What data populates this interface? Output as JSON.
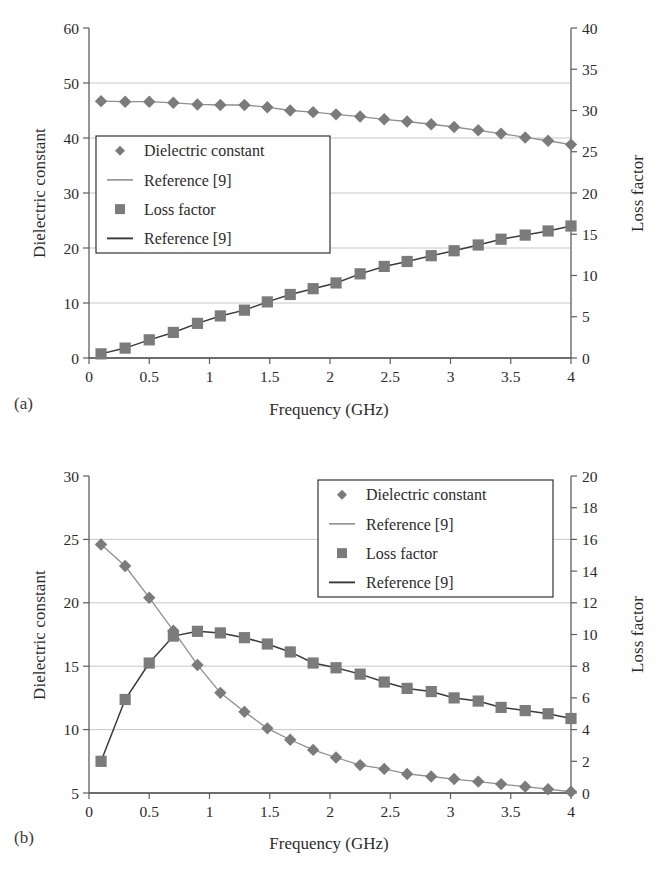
{
  "figure": {
    "panel_a_label": "(a)",
    "panel_b_label": "(b)"
  },
  "colors": {
    "marker_gray": "#7b7b7b",
    "line_light": "#8f8f8f",
    "line_dark": "#3a3a3a",
    "grid": "#b9b9b9",
    "axis": "#5e5e5e",
    "text": "#2b2b2b"
  },
  "legend": {
    "entries": [
      {
        "label": "Dielectric constant",
        "marker": "diamond-marker"
      },
      {
        "label": "Reference [9]",
        "marker": "light-line-marker"
      },
      {
        "label": "Loss factor",
        "marker": "square-marker"
      },
      {
        "label": "Reference [9]",
        "marker": "dark-line-marker"
      }
    ]
  },
  "chart_data": [
    {
      "id": "panel-a",
      "type": "scatter",
      "title": "",
      "panel": "(a)",
      "xlabel": "Frequency (GHz)",
      "ylabel": "Dielectric constant",
      "y2label": "Loss factor",
      "xlim": [
        0,
        4
      ],
      "ylim": [
        0,
        60
      ],
      "y2lim": [
        0,
        40
      ],
      "xticks": [
        0,
        0.5,
        1,
        1.5,
        2,
        2.5,
        3,
        3.5,
        4
      ],
      "xticklabels": [
        "0",
        "0.5",
        "1",
        "1.5",
        "2",
        "2.5",
        "3",
        "3.5",
        "4"
      ],
      "yticks": [
        0,
        10,
        20,
        30,
        40,
        50,
        60
      ],
      "yticklabels": [
        "0",
        "10",
        "20",
        "30",
        "40",
        "50",
        "60"
      ],
      "y2ticks": [
        0,
        5,
        10,
        15,
        20,
        25,
        30,
        35,
        40
      ],
      "y2ticklabels": [
        "0",
        "5",
        "10",
        "15",
        "20",
        "25",
        "30",
        "35",
        "40"
      ],
      "grid": true,
      "legend_position": "center-left",
      "series": [
        {
          "name": "Dielectric constant",
          "axis": "left",
          "marker": "diamond",
          "x": [
            0.1,
            0.3,
            0.5,
            0.7,
            0.9,
            1.09,
            1.29,
            1.48,
            1.67,
            1.86,
            2.05,
            2.25,
            2.45,
            2.64,
            2.84,
            3.03,
            3.23,
            3.42,
            3.62,
            3.81,
            4.0
          ],
          "values": [
            46.7,
            46.6,
            46.6,
            46.4,
            46.1,
            46.0,
            46.0,
            45.6,
            45.0,
            44.7,
            44.3,
            43.9,
            43.4,
            43.0,
            42.5,
            42.0,
            41.4,
            40.8,
            40.1,
            39.5,
            38.8
          ]
        },
        {
          "name": "Reference [9] (dielectric constant)",
          "axis": "left",
          "marker": "line-light",
          "x": [
            0.1,
            0.3,
            0.5,
            0.7,
            0.9,
            1.09,
            1.29,
            1.48,
            1.67,
            1.86,
            2.05,
            2.25,
            2.45,
            2.64,
            2.84,
            3.03,
            3.23,
            3.42,
            3.62,
            3.81,
            4.0
          ],
          "values": [
            46.7,
            46.6,
            46.6,
            46.4,
            46.1,
            46.0,
            46.0,
            45.6,
            45.0,
            44.7,
            44.3,
            43.9,
            43.4,
            43.0,
            42.5,
            42.0,
            41.4,
            40.8,
            40.1,
            39.5,
            38.8
          ]
        },
        {
          "name": "Loss factor",
          "axis": "right",
          "marker": "square",
          "x": [
            0.1,
            0.3,
            0.5,
            0.7,
            0.9,
            1.09,
            1.29,
            1.48,
            1.67,
            1.86,
            2.05,
            2.25,
            2.45,
            2.64,
            2.84,
            3.03,
            3.23,
            3.42,
            3.62,
            3.81,
            4.0
          ],
          "values": [
            0.5,
            1.2,
            2.2,
            3.1,
            4.2,
            5.1,
            5.8,
            6.8,
            7.7,
            8.4,
            9.1,
            10.2,
            11.1,
            11.7,
            12.4,
            13.0,
            13.7,
            14.4,
            14.9,
            15.4,
            16.0
          ]
        },
        {
          "name": "Reference [9] (loss factor)",
          "axis": "right",
          "marker": "line-dark",
          "x": [
            0.1,
            0.3,
            0.5,
            0.7,
            0.9,
            1.09,
            1.29,
            1.48,
            1.67,
            1.86,
            2.05,
            2.25,
            2.45,
            2.64,
            2.84,
            3.03,
            3.23,
            3.42,
            3.62,
            3.81,
            4.0
          ],
          "values": [
            0.5,
            1.2,
            2.2,
            3.1,
            4.2,
            5.1,
            5.8,
            6.8,
            7.7,
            8.4,
            9.1,
            10.2,
            11.1,
            11.7,
            12.4,
            13.0,
            13.7,
            14.4,
            14.9,
            15.4,
            16.0
          ]
        }
      ]
    },
    {
      "id": "panel-b",
      "type": "scatter",
      "title": "",
      "panel": "(b)",
      "xlabel": "Frequency (GHz)",
      "ylabel": "Dielectric constant",
      "y2label": "Loss factor",
      "xlim": [
        0,
        4
      ],
      "ylim": [
        5,
        30
      ],
      "y2lim": [
        0,
        20
      ],
      "xticks": [
        0,
        0.5,
        1,
        1.5,
        2,
        2.5,
        3,
        3.5,
        4
      ],
      "xticklabels": [
        "0",
        "0.5",
        "1",
        "1.5",
        "2",
        "2.5",
        "3",
        "3.5",
        "4"
      ],
      "yticks": [
        5,
        10,
        15,
        20,
        25,
        30
      ],
      "yticklabels": [
        "5",
        "10",
        "15",
        "20",
        "25",
        "30"
      ],
      "y2ticks": [
        0,
        2,
        4,
        6,
        8,
        10,
        12,
        14,
        16,
        18,
        20
      ],
      "y2ticklabels": [
        "0",
        "2",
        "4",
        "6",
        "8",
        "10",
        "12",
        "14",
        "16",
        "18",
        "20"
      ],
      "grid": true,
      "legend_position": "top-right",
      "series": [
        {
          "name": "Dielectric constant",
          "axis": "left",
          "marker": "diamond",
          "x": [
            0.1,
            0.3,
            0.5,
            0.7,
            0.9,
            1.09,
            1.29,
            1.48,
            1.67,
            1.86,
            2.05,
            2.25,
            2.45,
            2.64,
            2.84,
            3.03,
            3.23,
            3.42,
            3.62,
            3.81,
            4.0
          ],
          "values": [
            24.6,
            22.9,
            20.4,
            17.8,
            15.1,
            12.9,
            11.4,
            10.1,
            9.2,
            8.4,
            7.8,
            7.2,
            6.9,
            6.5,
            6.3,
            6.1,
            5.9,
            5.7,
            5.5,
            5.3,
            5.1
          ]
        },
        {
          "name": "Reference [9] (dielectric constant)",
          "axis": "left",
          "marker": "line-light",
          "x": [
            0.1,
            0.3,
            0.5,
            0.7,
            0.9,
            1.09,
            1.29,
            1.48,
            1.67,
            1.86,
            2.05,
            2.25,
            2.45,
            2.64,
            2.84,
            3.03,
            3.23,
            3.42,
            3.62,
            3.81,
            4.0
          ],
          "values": [
            24.6,
            22.9,
            20.4,
            17.8,
            15.1,
            12.9,
            11.4,
            10.1,
            9.2,
            8.4,
            7.8,
            7.2,
            6.9,
            6.5,
            6.3,
            6.1,
            5.9,
            5.7,
            5.5,
            5.3,
            5.1
          ]
        },
        {
          "name": "Loss factor",
          "axis": "right",
          "marker": "square",
          "x": [
            0.1,
            0.3,
            0.5,
            0.7,
            0.9,
            1.09,
            1.29,
            1.48,
            1.67,
            1.86,
            2.05,
            2.25,
            2.45,
            2.64,
            2.84,
            3.03,
            3.23,
            3.42,
            3.62,
            3.81,
            4.0
          ],
          "values": [
            2.0,
            5.9,
            8.2,
            9.9,
            10.2,
            10.1,
            9.8,
            9.4,
            8.9,
            8.2,
            7.9,
            7.5,
            7.0,
            6.6,
            6.4,
            6.0,
            5.8,
            5.4,
            5.2,
            5.0,
            4.7
          ]
        },
        {
          "name": "Reference [9] (loss factor)",
          "axis": "right",
          "marker": "line-dark",
          "x": [
            0.1,
            0.3,
            0.5,
            0.7,
            0.9,
            1.09,
            1.29,
            1.48,
            1.67,
            1.86,
            2.05,
            2.25,
            2.45,
            2.64,
            2.84,
            3.03,
            3.23,
            3.42,
            3.62,
            3.81,
            4.0
          ],
          "values": [
            2.0,
            5.9,
            8.2,
            9.9,
            10.2,
            10.1,
            9.8,
            9.4,
            8.9,
            8.2,
            7.9,
            7.5,
            7.0,
            6.6,
            6.4,
            6.0,
            5.8,
            5.4,
            5.2,
            5.0,
            4.7
          ]
        }
      ]
    }
  ]
}
